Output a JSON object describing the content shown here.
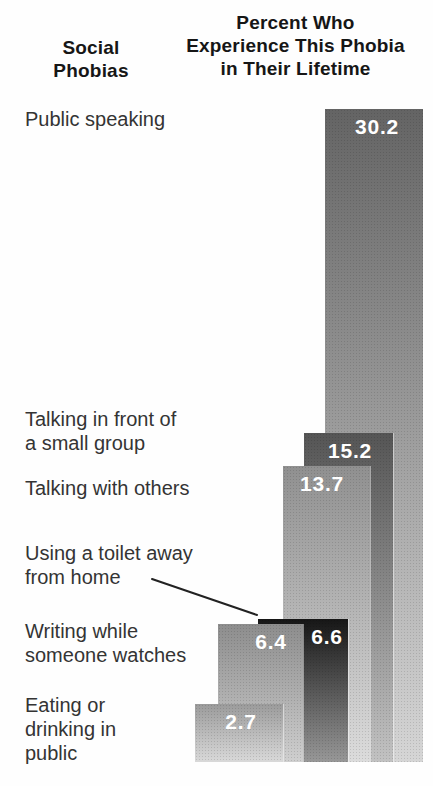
{
  "header": {
    "left": {
      "line1": "Social",
      "line2": "Phobias"
    },
    "right": {
      "line1": "Percent Who",
      "line2": "Experience This Phobia",
      "line3": "in Their Lifetime"
    }
  },
  "chart_data": {
    "type": "bar",
    "title_left": "Social Phobias",
    "title_right": "Percent Who Experience This Phobia in Their Lifetime",
    "unit": "percent",
    "value_range": [
      0,
      30.2
    ],
    "grid": false,
    "legend": false,
    "categories": [
      "Public speaking",
      "Talking in front of a small group",
      "Talking with others",
      "Using a toilet away from home",
      "Writing while someone watches",
      "Eating or drinking in public"
    ],
    "values": [
      30.2,
      15.2,
      13.7,
      6.6,
      6.4,
      2.7
    ],
    "baseline_px": 762,
    "px_per_unit": 21.62,
    "bars": [
      {
        "id": "public-speaking",
        "display": "30.2",
        "value": 30.2,
        "x": 325,
        "width": 98,
        "color_top": "#646464",
        "color_bottom": "#d6d6d6",
        "value_label_cx": 377,
        "label_lines": [
          "Public speaking"
        ],
        "label_x": 25,
        "label_y": 107
      },
      {
        "id": "talking-small-group",
        "display": "15.2",
        "value": 15.2,
        "x": 304,
        "width": 89,
        "color_top": "#555555",
        "color_bottom": "#c2c2c2",
        "value_label_cx": 350,
        "label_lines": [
          "Talking in front of",
          "a small group"
        ],
        "label_x": 25,
        "label_y": 407
      },
      {
        "id": "talking-with-others",
        "display": "13.7",
        "value": 13.7,
        "x": 283,
        "width": 87,
        "color_top": "#909090",
        "color_bottom": "#dcdcdc",
        "value_label_cx": 322,
        "label_lines": [
          "Talking with others"
        ],
        "label_x": 25,
        "label_y": 476
      },
      {
        "id": "toilet-away-from-home",
        "display": "6.6",
        "value": 6.6,
        "x": 258,
        "width": 90,
        "color_top": "#161616",
        "color_bottom": "#989898",
        "value_label_cx": 327,
        "label_lines": [
          "Using a toilet away",
          "from home"
        ],
        "label_x": 25,
        "label_y": 541
      },
      {
        "id": "writing-while-watched",
        "display": "6.4",
        "value": 6.4,
        "x": 218,
        "width": 85,
        "color_top": "#8d8d8d",
        "color_bottom": "#cfcfcf",
        "value_label_cx": 271,
        "label_lines": [
          "Writing while",
          "someone watches"
        ],
        "label_x": 25,
        "label_y": 619
      },
      {
        "id": "eating-drinking-public",
        "display": "2.7",
        "value": 2.7,
        "x": 195,
        "width": 88,
        "color_top": "#9b9b9b",
        "color_bottom": "#d9d9d9",
        "value_label_cx": 241,
        "label_lines": [
          "Eating or",
          "drinking in",
          "public"
        ],
        "label_x": 25,
        "label_y": 693
      }
    ],
    "callout": {
      "target_bar": "toilet-away-from-home",
      "x1": 152,
      "y1": 579,
      "x2": 257,
      "y2": 615,
      "color": "#222222"
    }
  }
}
